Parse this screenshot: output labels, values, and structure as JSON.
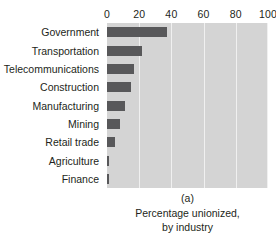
{
  "chart_data": {
    "type": "bar",
    "orientation": "horizontal",
    "title": "",
    "subtitle": "",
    "xlabel": "",
    "ylabel": "",
    "xlim": [
      0,
      100
    ],
    "grid": true,
    "legend": false,
    "axis_position": "top",
    "categories": [
      "Government",
      "Transportation",
      "Telecommunications",
      "Construction",
      "Manufacturing",
      "Mining",
      "Retail trade",
      "Agriculture",
      "Finance"
    ],
    "values": [
      37,
      22,
      17,
      15,
      11,
      8,
      5,
      1.5,
      1
    ],
    "xticks": [
      0,
      20,
      40,
      60,
      80,
      100
    ],
    "xtick_labels": [
      "0",
      "20",
      "40",
      "60",
      "80",
      "100"
    ],
    "bar_color": "#58585a",
    "plot_background": "#d4d4d4",
    "gridline_color": "#f0f0f0",
    "text_color": "#231f20"
  },
  "caption": {
    "panel_label": "(a)",
    "line1": "Percentage unionized,",
    "line2": "by industry"
  }
}
